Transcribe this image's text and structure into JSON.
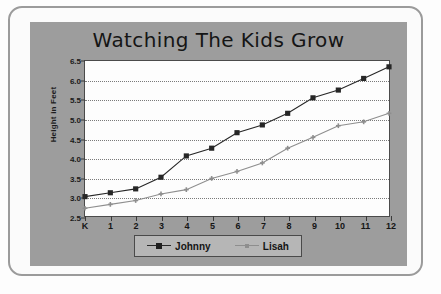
{
  "chart_data": {
    "type": "line",
    "title": "Watching The Kids Grow",
    "xlabel": "",
    "ylabel": "Height in Feet",
    "categories": [
      "K",
      "1",
      "2",
      "3",
      "4",
      "5",
      "6",
      "7",
      "8",
      "9",
      "10",
      "11",
      "12"
    ],
    "ylim": [
      2.5,
      6.5
    ],
    "yticks": [
      "2.5",
      "3.0",
      "3.5",
      "4.0",
      "4.5",
      "5.0",
      "5.5",
      "6.0",
      "6.5"
    ],
    "grid": true,
    "legend_position": "bottom",
    "series": [
      {
        "name": "Johnny",
        "color": "#262626",
        "marker": "square",
        "values": [
          3.0,
          3.1,
          3.2,
          3.5,
          4.05,
          4.25,
          4.65,
          4.85,
          5.15,
          5.55,
          5.75,
          6.05,
          6.35
        ]
      },
      {
        "name": "Lisah",
        "color": "#8e8e8e",
        "marker": "plus",
        "values": [
          2.7,
          2.8,
          2.9,
          3.07,
          3.18,
          3.47,
          3.65,
          3.87,
          4.25,
          4.53,
          4.83,
          4.93,
          5.15
        ]
      }
    ]
  },
  "colors": {
    "panel_background": "#9d9d9d",
    "plot_background": "#fdfdfd",
    "frame_border": "#9b9b9b",
    "axis": "#4b4b4b",
    "gridline": "#7a7a7a",
    "johnny": "#262626",
    "lisah": "#8e8e8e",
    "legend_background": "#b6b6b6"
  }
}
